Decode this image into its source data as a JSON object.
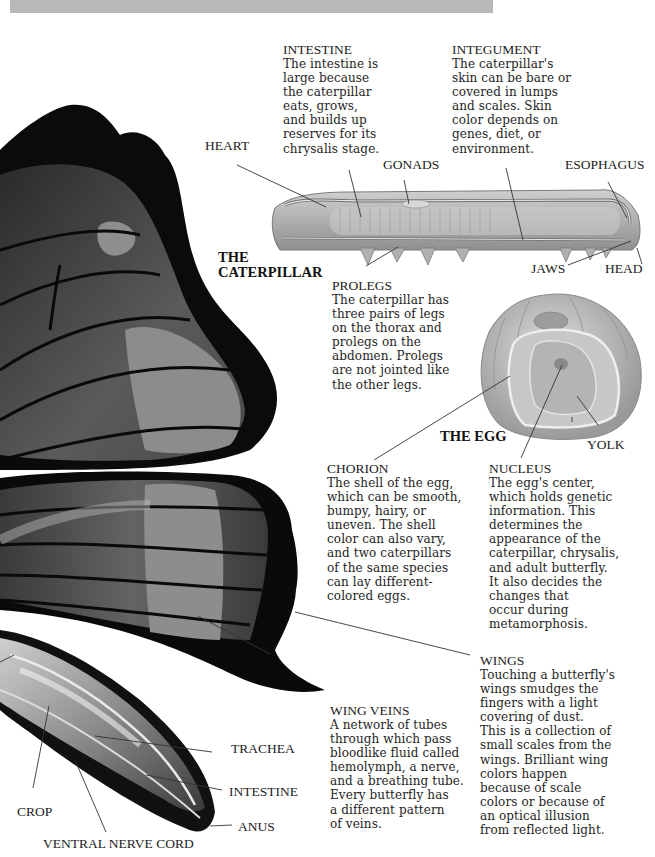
{
  "diagram": {
    "subjects": {
      "caterpillar_title": "THE\nCATERPILLAR",
      "caterpillar_title_line1": "THE",
      "caterpillar_title_line2": "CATERPILLAR",
      "egg_title": "THE EGG"
    },
    "caterpillar_labels": {
      "heart": "HEART",
      "gonads": "GONADS",
      "esophagus": "ESOPHAGUS",
      "jaws": "JAWS",
      "head": "HEAD"
    },
    "egg_labels": {
      "yolk": "YOLK"
    },
    "butterfly_labels": {
      "trachea": "TRACHEA",
      "intestine": "INTESTINE",
      "anus": "ANUS",
      "crop": "CROP",
      "ventral_nerve_cord": "VENTRAL NERVE CORD"
    },
    "notes": {
      "intestine": {
        "heading": "INTESTINE",
        "text": "The intestine is\nlarge because\nthe caterpillar\neats, grows,\nand builds up\nreserves for its\nchrysalis stage."
      },
      "integument": {
        "heading": "INTEGUMENT",
        "text": "The caterpillar's\nskin can be bare or\ncovered in lumps\nand scales.  Skin\ncolor depends on\ngenes, diet, or\nenvironment."
      },
      "prolegs": {
        "heading": "PROLEGS",
        "text": "The caterpillar has\nthree pairs of legs\non the thorax and\nprolegs on the\nabdomen. Prolegs\nare not jointed like\nthe other legs."
      },
      "chorion": {
        "heading": "CHORION",
        "text": "The shell of the egg,\nwhich can be smooth,\nbumpy, hairy, or\nuneven.  The shell\ncolor can also vary,\nand two caterpillars\nof the same species\ncan lay different-\ncolored eggs."
      },
      "nucleus": {
        "heading": "NUCLEUS",
        "text": "The egg's center,\nwhich holds genetic\ninformation. This\ndetermines the\nappearance of the\ncaterpillar, chrysalis,\nand adult butterfly.\nIt also decides the\nchanges that\noccur during\nmetamorphosis."
      },
      "wing_veins": {
        "heading": "WING VEINS",
        "text": "A network of tubes\nthrough which pass\nbloodlike fluid called\nhemolymph, a nerve,\nand a breathing tube.\nEvery butterfly has\na different pattern\nof veins."
      },
      "wings": {
        "heading": "WINGS",
        "text": "Touching a butterfly's\nwings smudges the\nfingers with a light\ncovering of dust.\nThis is a collection of\nsmall scales from the\nwings.  Brilliant wing\ncolors happen\nbecause of scale\ncolors or because of\nan optical illusion\nfrom reflected light."
      }
    },
    "colors": {
      "banner": "#b8b8b8",
      "wing_black": "#0a0a0a",
      "wing_gray": "#5a5a5a",
      "wing_band": "#8c8c8c",
      "caterpillar": "#b4b4b4",
      "egg": "#bdbdbd"
    }
  }
}
